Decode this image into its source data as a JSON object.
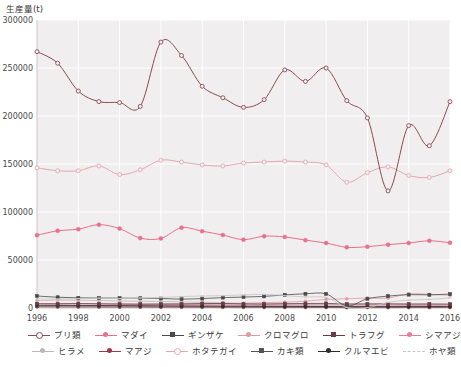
{
  "chart_data": {
    "type": "line",
    "title": "",
    "ylabel": "生産量(t)",
    "xlabel": "",
    "ylim": [
      0,
      300000
    ],
    "yticks": [
      0,
      50000,
      100000,
      150000,
      200000,
      250000,
      300000
    ],
    "ytick_labels": [
      "0",
      "50000",
      "100000",
      "150000",
      "200000",
      "250000",
      "300000"
    ],
    "xlim": [
      1996,
      2016
    ],
    "x": [
      1996,
      1997,
      1998,
      1999,
      2000,
      2001,
      2002,
      2003,
      2004,
      2005,
      2006,
      2007,
      2008,
      2009,
      2010,
      2011,
      2012,
      2013,
      2014,
      2015,
      2016
    ],
    "xtick_labels": [
      "1996",
      "1998",
      "2000",
      "2002",
      "2004",
      "2006",
      "2008",
      "2010",
      "2012",
      "2014",
      "2016"
    ],
    "xticks": [
      1996,
      1998,
      2000,
      2002,
      2004,
      2006,
      2008,
      2010,
      2012,
      2014,
      2016
    ],
    "grid": true,
    "legend_position": "bottom",
    "series": [
      {
        "name": "ブリ類",
        "color": "#8c4a52",
        "marker": "circle-open",
        "values": [
          267000,
          255000,
          226000,
          215000,
          214000,
          210000,
          277000,
          263000,
          231000,
          219000,
          209000,
          217000,
          248000,
          236000,
          250000,
          216000,
          198000,
          122000,
          190000,
          169000,
          215000
        ]
      },
      {
        "name": "マダイ",
        "color": "#e8718d",
        "marker": "circle-filled",
        "values": [
          75800,
          80400,
          82100,
          86800,
          82700,
          72800,
          72500,
          83600,
          80000,
          76000,
          71200,
          74800,
          74000,
          70700,
          67600,
          63200,
          63900,
          66000,
          67700,
          70000,
          68000
        ]
      },
      {
        "name": "ギンザケ",
        "color": "#4a4a4a",
        "marker": "square-filled",
        "values": [
          12500,
          11200,
          10600,
          10400,
          10300,
          10200,
          9900,
          9200,
          9800,
          10800,
          11400,
          12100,
          13600,
          14800,
          14700,
          2200,
          9600,
          12400,
          13900,
          13700,
          14500
        ]
      },
      {
        "name": "クロマグロ",
        "color": "#e09aa4",
        "marker": "circle-filled",
        "values": [
          1900,
          2100,
          2400,
          2600,
          2800,
          3000,
          3600,
          4000,
          4300,
          4700,
          5000,
          5500,
          6100,
          7000,
          9000,
          9600,
          10400,
          10400,
          14700,
          14200,
          13200
        ]
      },
      {
        "name": "トラフグ",
        "color": "#6b3a42",
        "marker": "square-filled",
        "values": [
          4400,
          4300,
          4600,
          4400,
          4200,
          4000,
          4200,
          4300,
          4600,
          4700,
          4300,
          4100,
          4500,
          4700,
          4800,
          4200,
          4300,
          4400,
          4200,
          4200,
          4000
        ]
      },
      {
        "name": "シマアジ",
        "color": "#e87f99",
        "marker": "circle-filled",
        "values": [
          4500,
          4600,
          4400,
          4100,
          3900,
          4000,
          3800,
          3600,
          3500,
          3400,
          3300,
          3300,
          3400,
          3500,
          3600,
          3300,
          3500,
          3600,
          3700,
          3800,
          3900
        ]
      },
      {
        "name": "ヒラメ",
        "color": "#bdb8b8",
        "marker": "circle-filled",
        "values": [
          7700,
          8200,
          8100,
          7800,
          7300,
          7000,
          6800,
          6400,
          5900,
          5500,
          4400,
          4300,
          4100,
          3800,
          3600,
          3000,
          3100,
          3000,
          2700,
          2400,
          2300
        ]
      },
      {
        "name": "マアジ",
        "color": "#9c3a4c",
        "marker": "circle-filled",
        "values": [
          1200,
          1100,
          1000,
          950,
          900,
          850,
          800,
          760,
          720,
          700,
          680,
          650,
          620,
          600,
          580,
          400,
          420,
          440,
          450,
          460,
          470
        ]
      },
      {
        "name": "ホタテガイ",
        "color": "#e3a8b0",
        "marker": "circle-open",
        "values": [
          146000,
          143000,
          143000,
          148000,
          139000,
          144000,
          154000,
          152000,
          149000,
          148000,
          151000,
          152000,
          153000,
          152000,
          149000,
          131000,
          141000,
          147000,
          138000,
          136000,
          143000
        ]
      },
      {
        "name": "カキ類",
        "color": "#555555",
        "marker": "square-filled",
        "values": [
          2100,
          2200,
          2100,
          2000,
          2100,
          2000,
          1900,
          1900,
          1800,
          1800,
          1900,
          1900,
          1900,
          1900,
          1800,
          1600,
          1700,
          1700,
          1800,
          1800,
          1800
        ]
      },
      {
        "name": "クルマエビ",
        "color": "#2e2e2e",
        "marker": "circle-filled",
        "values": [
          2900,
          2800,
          2700,
          2500,
          2400,
          2300,
          2200,
          2100,
          2000,
          1900,
          1800,
          1700,
          1600,
          1600,
          1500,
          1300,
          1400,
          1400,
          1400,
          1500,
          1500
        ]
      },
      {
        "name": "ホヤ類",
        "color": "#c9c4c4",
        "marker": "dash",
        "values": [
          9600,
          9300,
          9800,
          10200,
          9800,
          10300,
          10800,
          11900,
          12500,
          12900,
          13600,
          14200,
          12900,
          11500,
          11000,
          600,
          400,
          5800,
          8200,
          9000,
          10500
        ]
      }
    ]
  }
}
